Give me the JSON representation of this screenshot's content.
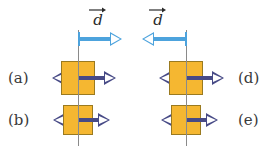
{
  "figure": {
    "width": 274,
    "height": 146,
    "background": "#ffffff",
    "colors": {
      "block_fill": "#f5b731",
      "block_stroke": "#9a7a20",
      "force_arrow": "#474a86",
      "displacement_arrow": "#4da3dd",
      "reference_line": "#8a8a8a",
      "text": "#3a3a3a"
    }
  },
  "reference_lines": [
    {
      "name": "left-reference-line",
      "x": 78,
      "y": 30,
      "height": 116
    },
    {
      "name": "right-reference-line",
      "x": 186,
      "y": 30,
      "height": 116
    }
  ],
  "displacement": {
    "label_text": "d",
    "left": {
      "name": "displacement-arrow-left",
      "direction": "right",
      "x": 78,
      "y": 32,
      "length": 44,
      "label_x": 88,
      "label_y": 6
    },
    "right": {
      "name": "displacement-arrow-right",
      "direction": "left",
      "x": 142,
      "y": 32,
      "length": 44,
      "label_x": 148,
      "label_y": 6
    }
  },
  "panels": [
    {
      "id": "a",
      "label": "(a)",
      "label_x": 8,
      "label_y": 71,
      "label_side": "left",
      "center_x": 78,
      "center_y": 78,
      "block": {
        "x": 61,
        "y": 61,
        "w": 34,
        "h": 34
      },
      "left_force": {
        "length": 26,
        "head": "left"
      },
      "right_force": {
        "length": 38,
        "head": "right"
      }
    },
    {
      "id": "b",
      "label": "(b)",
      "label_x": 8,
      "label_y": 113,
      "label_side": "left",
      "center_x": 78,
      "center_y": 120,
      "block": {
        "x": 63,
        "y": 105,
        "w": 30,
        "h": 30
      },
      "left_force": {
        "length": 25,
        "head": "left"
      },
      "right_force": {
        "length": 32,
        "head": "right"
      }
    },
    {
      "id": "d",
      "label": "(d)",
      "label_x": 238,
      "label_y": 71,
      "label_side": "right",
      "center_x": 186,
      "center_y": 78,
      "block": {
        "x": 169,
        "y": 61,
        "w": 34,
        "h": 34
      },
      "left_force": {
        "length": 27,
        "head": "left"
      },
      "right_force": {
        "length": 38,
        "head": "right"
      }
    },
    {
      "id": "e",
      "label": "(e)",
      "label_x": 238,
      "label_y": 113,
      "label_side": "right",
      "center_x": 186,
      "center_y": 120,
      "block": {
        "x": 171,
        "y": 105,
        "w": 30,
        "h": 30
      },
      "left_force": {
        "length": 25,
        "head": "left"
      },
      "right_force": {
        "length": 32,
        "head": "right"
      }
    }
  ]
}
